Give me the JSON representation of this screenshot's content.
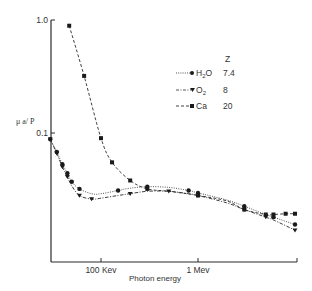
{
  "chart_data": {
    "type": "line",
    "title": "",
    "xlabel": "Photon energy",
    "ylabel": "μ a/ P",
    "xscale": "log",
    "yscale": "log",
    "xlim_kev": [
      30,
      10000
    ],
    "ylim": [
      0.0075,
      1.0
    ],
    "x_ticks": [
      {
        "label": "100 Kev",
        "value_kev": 100
      },
      {
        "label": "1 Mev",
        "value_kev": 1000
      }
    ],
    "y_ticks": [
      {
        "label": "1.0",
        "value": 1.0
      },
      {
        "label": "0.1",
        "value": 0.1
      }
    ],
    "grid": false,
    "legend_position": "upper right",
    "legend_header": "Z",
    "series": [
      {
        "name": "H2O",
        "name_main": "H",
        "name_sub": "2",
        "name_tail": "O",
        "z": "7.4",
        "line_style": "dotted",
        "marker": "circle",
        "x_kev": [
          30,
          35,
          40,
          45,
          50,
          60,
          80,
          100,
          150,
          200,
          300,
          500,
          800,
          1000,
          2000,
          3000,
          5000,
          6000,
          10000
        ],
        "y": [
          0.088,
          0.068,
          0.053,
          0.044,
          0.037,
          0.032,
          0.029,
          0.029,
          0.031,
          0.0325,
          0.0335,
          0.033,
          0.031,
          0.0295,
          0.0255,
          0.0225,
          0.019,
          0.018,
          0.0155
        ]
      },
      {
        "name": "O2",
        "name_main": "O",
        "name_sub": "2",
        "name_tail": "",
        "z": "8",
        "line_style": "dash-dot",
        "marker": "triangle-down",
        "x_kev": [
          30,
          35,
          40,
          45,
          50,
          60,
          80,
          100,
          150,
          200,
          300,
          500,
          800,
          1000,
          2000,
          3000,
          5000,
          6000,
          10000
        ],
        "y": [
          0.088,
          0.066,
          0.05,
          0.041,
          0.034,
          0.028,
          0.026,
          0.0265,
          0.028,
          0.029,
          0.0305,
          0.0305,
          0.029,
          0.028,
          0.024,
          0.021,
          0.018,
          0.017,
          0.0138
        ]
      },
      {
        "name": "Ca",
        "name_main": "Ca",
        "name_sub": "",
        "name_tail": "",
        "z": "20",
        "line_style": "dashed",
        "marker": "square",
        "x_kev": [
          47,
          67,
          100,
          130,
          200,
          300,
          500,
          1000,
          2000,
          3000,
          5000,
          6000,
          8000,
          10000
        ],
        "y": [
          0.89,
          0.32,
          0.09,
          0.055,
          0.038,
          0.032,
          0.0305,
          0.028,
          0.025,
          0.021,
          0.019,
          0.019,
          0.0193,
          0.0193
        ]
      }
    ]
  },
  "axes": {
    "xlabel": "Photon energy",
    "ylabel": "μ a/ P",
    "xtick_100kev": "100 Kev",
    "xtick_1mev": "1 Mev",
    "ytick_1": "1.0",
    "ytick_01": "0.1"
  },
  "legend": {
    "header": "Z",
    "h2o_main": "H",
    "h2o_sub": "2",
    "h2o_tail": "O",
    "h2o_z": "7.4",
    "o2_main": "O",
    "o2_sub": "2",
    "o2_z": "8",
    "ca_main": "Ca",
    "ca_z": "20"
  },
  "colors": {
    "ink": "#2a2a2a",
    "background": "#ffffff"
  }
}
